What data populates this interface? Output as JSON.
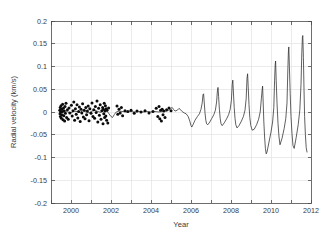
{
  "chart_data": {
    "type": "line",
    "title": "",
    "xlabel": "Year",
    "ylabel": "Radial velocity (km/s)",
    "xlim": [
      1999,
      2012
    ],
    "ylim": [
      -0.2,
      0.2
    ],
    "grid": true,
    "legend": null,
    "xticks": [
      1999,
      2000,
      2001,
      2002,
      2003,
      2004,
      2005,
      2006,
      2007,
      2008,
      2009,
      2010,
      2011,
      2012
    ],
    "xtick_labels": [
      "",
      "2000",
      "",
      "2002",
      "",
      "2004",
      "",
      "2006",
      "",
      "2008",
      "",
      "2010",
      "",
      "2012"
    ],
    "yticks": [
      -0.2,
      -0.15,
      -0.1,
      -0.05,
      0,
      0.05,
      0.1,
      0.15,
      0.2
    ],
    "ytick_labels": [
      "-0.2",
      "-0.15",
      "-0.1",
      "-0.05",
      "0",
      "0.05",
      "0.1",
      "0.15",
      "0.2"
    ],
    "series": [
      {
        "name": "model",
        "type": "line",
        "color": "#2b2b2b",
        "points": [
          [
            1999.42,
            0.002
          ],
          [
            1999.55,
            -0.001
          ],
          [
            1999.7,
            0.003
          ],
          [
            1999.85,
            0.0
          ],
          [
            2000.0,
            -0.002
          ],
          [
            2000.15,
            0.002
          ],
          [
            2000.3,
            0.001
          ],
          [
            2000.45,
            -0.001
          ],
          [
            2000.6,
            0.003
          ],
          [
            2000.75,
            0.0
          ],
          [
            2000.9,
            -0.002
          ],
          [
            2001.05,
            0.002
          ],
          [
            2001.2,
            0.004
          ],
          [
            2001.35,
            0.001
          ],
          [
            2001.5,
            -0.001
          ],
          [
            2001.62,
            0.004
          ],
          [
            2001.72,
            0.006
          ],
          [
            2001.8,
            0.002
          ],
          [
            2001.9,
            -0.004
          ],
          [
            2002.0,
            -0.01
          ],
          [
            2002.08,
            -0.012
          ],
          [
            2002.16,
            -0.006
          ],
          [
            2002.26,
            0.0
          ],
          [
            2002.4,
            0.002
          ],
          [
            2002.6,
            0.001
          ],
          [
            2002.8,
            0.0
          ],
          [
            2003.0,
            0.001
          ],
          [
            2003.2,
            0.0
          ],
          [
            2003.4,
            0.001
          ],
          [
            2003.6,
            0.0
          ],
          [
            2003.8,
            0.001
          ],
          [
            2004.0,
            0.0
          ],
          [
            2004.2,
            0.001
          ],
          [
            2004.4,
            0.0
          ],
          [
            2004.6,
            0.001
          ],
          [
            2004.8,
            0.002
          ],
          [
            2004.92,
            0.005
          ],
          [
            2005.0,
            0.008
          ],
          [
            2005.06,
            0.01
          ],
          [
            2005.12,
            0.006
          ],
          [
            2005.2,
            0.002
          ],
          [
            2005.32,
            0.004
          ],
          [
            2005.4,
            0.008
          ],
          [
            2005.48,
            0.005
          ],
          [
            2005.56,
            0.001
          ],
          [
            2005.66,
            -0.002
          ],
          [
            2005.76,
            -0.004
          ],
          [
            2005.86,
            -0.01
          ],
          [
            2005.94,
            -0.02
          ],
          [
            2006.0,
            -0.03
          ],
          [
            2006.04,
            -0.033
          ],
          [
            2006.1,
            -0.028
          ],
          [
            2006.2,
            -0.018
          ],
          [
            2006.32,
            -0.01
          ],
          [
            2006.42,
            -0.004
          ],
          [
            2006.5,
            0.006
          ],
          [
            2006.56,
            0.02
          ],
          [
            2006.6,
            0.038
          ],
          [
            2006.63,
            0.04
          ],
          [
            2006.66,
            0.022
          ],
          [
            2006.7,
            -0.002
          ],
          [
            2006.74,
            -0.018
          ],
          [
            2006.78,
            -0.026
          ],
          [
            2006.84,
            -0.028
          ],
          [
            2006.94,
            -0.022
          ],
          [
            2007.04,
            -0.014
          ],
          [
            2007.14,
            -0.006
          ],
          [
            2007.22,
            0.004
          ],
          [
            2007.28,
            0.022
          ],
          [
            2007.32,
            0.046
          ],
          [
            2007.35,
            0.054
          ],
          [
            2007.38,
            0.034
          ],
          [
            2007.42,
            0.006
          ],
          [
            2007.46,
            -0.014
          ],
          [
            2007.5,
            -0.026
          ],
          [
            2007.56,
            -0.03
          ],
          [
            2007.66,
            -0.024
          ],
          [
            2007.78,
            -0.015
          ],
          [
            2007.88,
            -0.006
          ],
          [
            2007.96,
            0.006
          ],
          [
            2008.02,
            0.026
          ],
          [
            2008.06,
            0.06
          ],
          [
            2008.09,
            0.07
          ],
          [
            2008.12,
            0.044
          ],
          [
            2008.16,
            0.01
          ],
          [
            2008.2,
            -0.014
          ],
          [
            2008.24,
            -0.028
          ],
          [
            2008.3,
            -0.035
          ],
          [
            2008.4,
            -0.03
          ],
          [
            2008.52,
            -0.02
          ],
          [
            2008.62,
            -0.01
          ],
          [
            2008.7,
            0.004
          ],
          [
            2008.76,
            0.03
          ],
          [
            2008.8,
            0.074
          ],
          [
            2008.83,
            0.084
          ],
          [
            2008.86,
            0.056
          ],
          [
            2008.9,
            0.016
          ],
          [
            2008.94,
            -0.012
          ],
          [
            2008.99,
            -0.03
          ],
          [
            2009.06,
            -0.04
          ],
          [
            2009.16,
            -0.038
          ],
          [
            2009.28,
            -0.028
          ],
          [
            2009.38,
            -0.016
          ],
          [
            2009.46,
            0.0
          ],
          [
            2009.52,
            0.03
          ],
          [
            2009.56,
            0.05
          ],
          [
            2009.58,
            0.057
          ],
          [
            2009.61,
            0.02
          ],
          [
            2009.64,
            -0.02
          ],
          [
            2009.68,
            -0.055
          ],
          [
            2009.72,
            -0.08
          ],
          [
            2009.76,
            -0.092
          ],
          [
            2009.8,
            -0.088
          ],
          [
            2009.9,
            -0.066
          ],
          [
            2010.0,
            -0.044
          ],
          [
            2010.08,
            -0.022
          ],
          [
            2010.14,
            0.01
          ],
          [
            2010.18,
            0.07
          ],
          [
            2010.21,
            0.104
          ],
          [
            2010.23,
            0.112
          ],
          [
            2010.26,
            0.07
          ],
          [
            2010.3,
            0.02
          ],
          [
            2010.35,
            -0.025
          ],
          [
            2010.4,
            -0.055
          ],
          [
            2010.45,
            -0.072
          ],
          [
            2010.55,
            -0.058
          ],
          [
            2010.66,
            -0.036
          ],
          [
            2010.74,
            -0.014
          ],
          [
            2010.8,
            0.02
          ],
          [
            2010.84,
            0.09
          ],
          [
            2010.87,
            0.132
          ],
          [
            2010.89,
            0.143
          ],
          [
            2010.92,
            0.1
          ],
          [
            2010.96,
            0.04
          ],
          [
            2011.0,
            -0.01
          ],
          [
            2011.05,
            -0.048
          ],
          [
            2011.1,
            -0.074
          ],
          [
            2011.16,
            -0.08
          ],
          [
            2011.26,
            -0.056
          ],
          [
            2011.36,
            -0.028
          ],
          [
            2011.44,
            0.004
          ],
          [
            2011.5,
            0.06
          ],
          [
            2011.54,
            0.13
          ],
          [
            2011.57,
            0.164
          ],
          [
            2011.59,
            0.168
          ],
          [
            2011.62,
            0.12
          ],
          [
            2011.65,
            0.05
          ],
          [
            2011.68,
            -0.01
          ],
          [
            2011.72,
            -0.05
          ],
          [
            2011.76,
            -0.078
          ],
          [
            2011.8,
            -0.088
          ]
        ]
      },
      {
        "name": "observations",
        "type": "scatter",
        "color": "#0b0b0b",
        "marker": "filled-circle",
        "points": [
          [
            1999.44,
            0.004
          ],
          [
            1999.45,
            -0.004
          ],
          [
            1999.46,
            0.01
          ],
          [
            1999.47,
            -0.01
          ],
          [
            1999.48,
            0.0
          ],
          [
            1999.5,
            0.014
          ],
          [
            1999.52,
            -0.014
          ],
          [
            1999.53,
            0.006
          ],
          [
            1999.55,
            -0.006
          ],
          [
            1999.57,
            0.001
          ],
          [
            1999.58,
            0.017
          ],
          [
            1999.6,
            -0.017
          ],
          [
            1999.62,
            0.008
          ],
          [
            1999.64,
            -0.008
          ],
          [
            1999.66,
            0.002
          ],
          [
            1999.68,
            -0.02
          ],
          [
            1999.7,
            0.012
          ],
          [
            1999.72,
            -0.003
          ],
          [
            1999.75,
            0.019
          ],
          [
            1999.78,
            -0.012
          ],
          [
            1999.82,
            0.005
          ],
          [
            1999.86,
            -0.016
          ],
          [
            1999.9,
            0.009
          ],
          [
            1999.94,
            -0.002
          ],
          [
            2000.02,
            0.015
          ],
          [
            2000.06,
            -0.009
          ],
          [
            2000.1,
            0.003
          ],
          [
            2000.14,
            0.022
          ],
          [
            2000.18,
            -0.018
          ],
          [
            2000.22,
            0.007
          ],
          [
            2000.26,
            -0.005
          ],
          [
            2000.3,
            0.016
          ],
          [
            2000.34,
            -0.013
          ],
          [
            2000.38,
            0.001
          ],
          [
            2000.42,
            0.011
          ],
          [
            2000.46,
            -0.021
          ],
          [
            2000.5,
            0.006
          ],
          [
            2000.54,
            -0.002
          ],
          [
            2000.58,
            0.018
          ],
          [
            2000.62,
            -0.011
          ],
          [
            2000.66,
            0.004
          ],
          [
            2000.7,
            -0.015
          ],
          [
            2000.74,
            0.01
          ],
          [
            2000.78,
            -0.006
          ],
          [
            2000.82,
            0.002
          ],
          [
            2000.86,
            0.013
          ],
          [
            2000.9,
            -0.019
          ],
          [
            2000.94,
            0.007
          ],
          [
            2001.0,
            -0.003
          ],
          [
            2001.05,
            0.02
          ],
          [
            2001.1,
            -0.01
          ],
          [
            2001.14,
            0.005
          ],
          [
            2001.18,
            -0.014
          ],
          [
            2001.22,
            0.012
          ],
          [
            2001.26,
            -0.001
          ],
          [
            2001.3,
            0.024
          ],
          [
            2001.34,
            -0.022
          ],
          [
            2001.38,
            0.008
          ],
          [
            2001.42,
            -0.007
          ],
          [
            2001.46,
            0.016
          ],
          [
            2001.5,
            -0.016
          ],
          [
            2001.54,
            0.003
          ],
          [
            2001.58,
            0.01
          ],
          [
            2001.6,
            -0.026
          ],
          [
            2001.62,
            0.006
          ],
          [
            2001.64,
            -0.004
          ],
          [
            2001.66,
            0.019
          ],
          [
            2001.68,
            -0.012
          ],
          [
            2001.7,
            0.002
          ],
          [
            2001.72,
            0.014
          ],
          [
            2001.74,
            -0.009
          ],
          [
            2001.76,
            0.007
          ],
          [
            2001.78,
            -0.018
          ],
          [
            2001.8,
            0.004
          ],
          [
            2001.84,
            -0.024
          ],
          [
            2001.88,
            0.009
          ],
          [
            2002.3,
            0.013
          ],
          [
            2002.34,
            -0.005
          ],
          [
            2002.4,
            0.006
          ],
          [
            2002.46,
            -0.002
          ],
          [
            2002.52,
            0.01
          ],
          [
            2002.58,
            -0.008
          ],
          [
            2002.7,
            0.003
          ],
          [
            2002.84,
            0.001
          ],
          [
            2003.0,
            0.004
          ],
          [
            2003.16,
            -0.003
          ],
          [
            2003.3,
            0.002
          ],
          [
            2003.5,
            0.0
          ],
          [
            2003.7,
            0.003
          ],
          [
            2003.9,
            -0.002
          ],
          [
            2004.1,
            0.001
          ],
          [
            2004.26,
            0.008
          ],
          [
            2004.34,
            -0.01
          ],
          [
            2004.4,
            0.012
          ],
          [
            2004.44,
            -0.015
          ],
          [
            2004.48,
            0.004
          ],
          [
            2004.52,
            -0.02
          ],
          [
            2004.56,
            0.006
          ],
          [
            2004.6,
            -0.006
          ],
          [
            2004.64,
            0.002
          ],
          [
            2004.7,
            -0.012
          ],
          [
            2004.78,
            0.005
          ],
          [
            2004.9,
            0.009
          ],
          [
            2005.0,
            0.003
          ]
        ]
      }
    ]
  },
  "axis": {
    "xlabel": "Year",
    "ylabel": "Radial velocity (km/s)"
  }
}
